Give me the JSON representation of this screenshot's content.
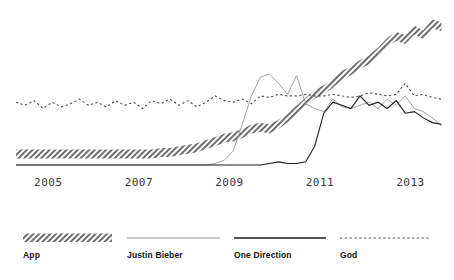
{
  "chart_data": {
    "type": "line",
    "title": "",
    "subtitle": "",
    "xlabel": "",
    "ylabel": "",
    "grid": false,
    "legend_position": "bottom",
    "xlim": [
      2004.6,
      2014.1
    ],
    "ylim": [
      0,
      100
    ],
    "xticks": [
      2005,
      2007,
      2009,
      2011,
      2013
    ],
    "xtick_labels": [
      "2005",
      "2007",
      "2009",
      "2011",
      "2013"
    ],
    "ytick_labels": [],
    "x": [
      2004.6,
      2004.8,
      2005.0,
      2005.2,
      2005.4,
      2005.6,
      2005.8,
      2006.0,
      2006.2,
      2006.4,
      2006.6,
      2006.8,
      2007.0,
      2007.2,
      2007.4,
      2007.6,
      2007.8,
      2008.0,
      2008.2,
      2008.4,
      2008.6,
      2008.8,
      2009.0,
      2009.2,
      2009.4,
      2009.6,
      2009.8,
      2010.0,
      2010.2,
      2010.4,
      2010.6,
      2010.8,
      2011.0,
      2011.2,
      2011.4,
      2011.6,
      2011.8,
      2012.0,
      2012.2,
      2012.4,
      2012.6,
      2012.8,
      2013.0,
      2013.2,
      2013.4,
      2013.6,
      2013.8,
      2014.0
    ],
    "series": [
      {
        "name": "App",
        "style": "hatched-band",
        "color": "#6d6d6d",
        "band_width": 9,
        "values": [
          7,
          7,
          7,
          7,
          7,
          7,
          7,
          7,
          7,
          7,
          7,
          7,
          7,
          7,
          7,
          7,
          8,
          8,
          9,
          10,
          11,
          13,
          15,
          17,
          18,
          20,
          23,
          24,
          23,
          26,
          30,
          35,
          40,
          45,
          48,
          52,
          57,
          60,
          64,
          67,
          72,
          78,
          82,
          80,
          86,
          83,
          90,
          88
        ]
      },
      {
        "name": "Justin Bieber",
        "style": "solid-light",
        "color": "#999999",
        "width": 0.9,
        "values": [
          0,
          0,
          0,
          0,
          0,
          0,
          0,
          0,
          0,
          0,
          0,
          0,
          0,
          0,
          0,
          0,
          0,
          0,
          0,
          0,
          0,
          0,
          1,
          3,
          9,
          26,
          44,
          56,
          58,
          52,
          45,
          57,
          39,
          36,
          34,
          42,
          37,
          36,
          38,
          40,
          36,
          42,
          38,
          44,
          36,
          34,
          30,
          25
        ]
      },
      {
        "name": "One Direction",
        "style": "solid-dark",
        "color": "#1a1a1a",
        "width": 1.1,
        "values": [
          0,
          0,
          0,
          0,
          0,
          0,
          0,
          0,
          0,
          0,
          0,
          0,
          0,
          0,
          0,
          0,
          0,
          0,
          0,
          0,
          0,
          0,
          0,
          0,
          0,
          0,
          0,
          0,
          1,
          2,
          1,
          1,
          2,
          12,
          33,
          40,
          38,
          36,
          44,
          38,
          40,
          36,
          41,
          33,
          34,
          30,
          27,
          26
        ]
      },
      {
        "name": "God",
        "style": "dotted",
        "color": "#4a4a4a",
        "width": 1.1,
        "values": [
          40,
          38,
          41,
          36,
          40,
          37,
          39,
          42,
          38,
          40,
          37,
          41,
          38,
          40,
          36,
          41,
          39,
          42,
          38,
          41,
          37,
          40,
          44,
          41,
          40,
          42,
          39,
          44,
          43,
          45,
          44,
          44,
          45,
          44,
          44,
          45,
          44,
          43,
          44,
          46,
          45,
          44,
          45,
          52,
          44,
          45,
          43,
          42
        ]
      }
    ]
  },
  "axis": {
    "ticks": [
      {
        "label": "2005",
        "x": 2005
      },
      {
        "label": "2007",
        "x": 2007
      },
      {
        "label": "2009",
        "x": 2009
      },
      {
        "label": "2011",
        "x": 2011
      },
      {
        "label": "2013",
        "x": 2013
      }
    ]
  },
  "legend": {
    "items": [
      {
        "label": "App",
        "marker": "hatched-band",
        "color": "#6d6d6d"
      },
      {
        "label": "Justin Bieber",
        "marker": "line-light",
        "color": "#999999"
      },
      {
        "label": "One Direction",
        "marker": "line-dark",
        "color": "#1a1a1a"
      },
      {
        "label": "God",
        "marker": "line-dotted",
        "color": "#4a4a4a"
      }
    ]
  },
  "colors": {
    "background": "#ffffff",
    "app": "#6d6d6d",
    "justin_bieber": "#999999",
    "one_direction": "#1a1a1a",
    "god": "#4a4a4a",
    "axis_text": "#3a3a3a",
    "legend_text": "#111111"
  }
}
